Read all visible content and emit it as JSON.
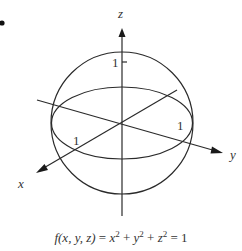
{
  "figure": {
    "bullet": "•",
    "axes": {
      "x_label": "x",
      "y_label": "y",
      "z_label": "z"
    },
    "ticks": {
      "x_tick": "1",
      "y_tick": "1",
      "z_tick": "1"
    },
    "formula": {
      "lhs": "f(x, y, z)",
      "eq1": " = ",
      "t1": "x",
      "e1": "2",
      "p1": " + ",
      "t2": "y",
      "e2": "2",
      "p2": " + ",
      "t3": "z",
      "e3": "2",
      "eq2": " = 1"
    },
    "stroke_color": "#2a2a2a"
  }
}
